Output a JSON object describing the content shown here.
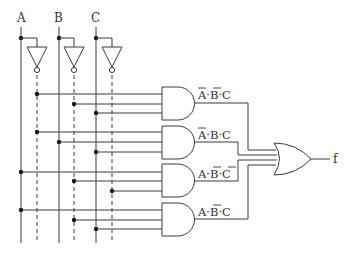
{
  "diagram": {
    "type": "logic-circuit",
    "inputs": [
      {
        "name": "A",
        "x": 21,
        "inv_x": 37
      },
      {
        "name": "B",
        "x": 59,
        "inv_x": 74
      },
      {
        "name": "C",
        "x": 96,
        "inv_x": 112
      }
    ],
    "and_gates": [
      {
        "id": 1,
        "term": [
          {
            "v": "A",
            "neg": true
          },
          {
            "v": "B",
            "neg": true
          },
          {
            "v": "C",
            "neg": false
          }
        ],
        "label": "Ā·B̄·C"
      },
      {
        "id": 2,
        "term": [
          {
            "v": "A",
            "neg": true
          },
          {
            "v": "B",
            "neg": false
          },
          {
            "v": "C",
            "neg": false
          }
        ],
        "label": "Ā·B·C"
      },
      {
        "id": 3,
        "term": [
          {
            "v": "A",
            "neg": false
          },
          {
            "v": "B",
            "neg": true
          },
          {
            "v": "C",
            "neg": true
          }
        ],
        "label": "A·B̄·C̄"
      },
      {
        "id": 4,
        "term": [
          {
            "v": "A",
            "neg": false
          },
          {
            "v": "B",
            "neg": true
          },
          {
            "v": "C",
            "neg": false
          }
        ],
        "label": "A·B̄·C"
      }
    ],
    "or_gate": {
      "output": "f"
    },
    "labels": {
      "input_a": "A",
      "input_b": "B",
      "input_c": "C",
      "output": "f",
      "dot": "·"
    },
    "colors": {
      "line": "#3a3a3a",
      "text": "#333333",
      "background": "#ffffff"
    }
  }
}
